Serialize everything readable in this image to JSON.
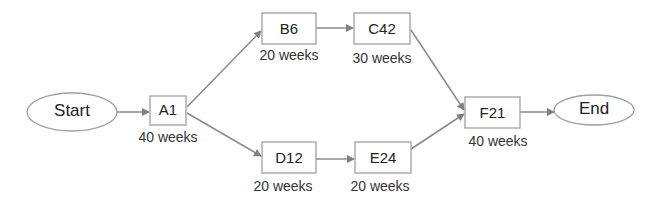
{
  "diagram": {
    "type": "project network",
    "nodes": {
      "start": {
        "label": "Start"
      },
      "a1": {
        "label": "A1",
        "duration": "40 weeks"
      },
      "b6": {
        "label": "B6",
        "duration": "20 weeks"
      },
      "c42": {
        "label": "C42",
        "duration": "30 weeks"
      },
      "d12": {
        "label": "D12",
        "duration": "20 weeks"
      },
      "e24": {
        "label": "E24",
        "duration": "20 weeks"
      },
      "f21": {
        "label": "F21",
        "duration": "40 weeks"
      },
      "end": {
        "label": "End"
      }
    },
    "edges": [
      [
        "Start",
        "A1"
      ],
      [
        "A1",
        "B6"
      ],
      [
        "A1",
        "D12"
      ],
      [
        "B6",
        "C42"
      ],
      [
        "D12",
        "E24"
      ],
      [
        "C42",
        "F21"
      ],
      [
        "E24",
        "F21"
      ],
      [
        "F21",
        "End"
      ]
    ],
    "colors": {
      "stroke": "#999999",
      "arrow": "#808080",
      "fill": "#ffffff"
    }
  }
}
